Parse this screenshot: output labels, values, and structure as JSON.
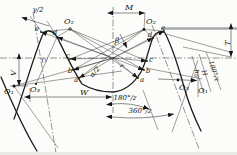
{
  "diagram": {
    "type": "technical-diagram",
    "colors": {
      "background": "#fcfcfa",
      "line": "#1c1c1c",
      "tip_line": "#a8a8a8"
    },
    "labels": {
      "gamma_half": "γ/2",
      "o2_left": "O₂",
      "m_dim": "M",
      "o2_right": "O₂",
      "beta": "β",
      "e_left": "e",
      "d_left": "d",
      "d_right": "d",
      "e_right": "e",
      "t_dim": "T",
      "v_dim": "V",
      "r1": "r₁",
      "r": "r",
      "c_left": "c",
      "b_left": "b",
      "a_left": "a",
      "alpha_half": "α/2",
      "c_right": "c",
      "b_right": "b",
      "a_right": "a",
      "o1_left": "O₁",
      "o3_left": "O₃",
      "w_dim": "W",
      "angle_180": "180°/z",
      "angle_360": "360°/z",
      "o3_right": "O₃",
      "o1_right": "O₁",
      "h_main": "h",
      "h_sub": "a",
      "h_cap": "H",
      "angle_180_right": "180°/z"
    }
  }
}
